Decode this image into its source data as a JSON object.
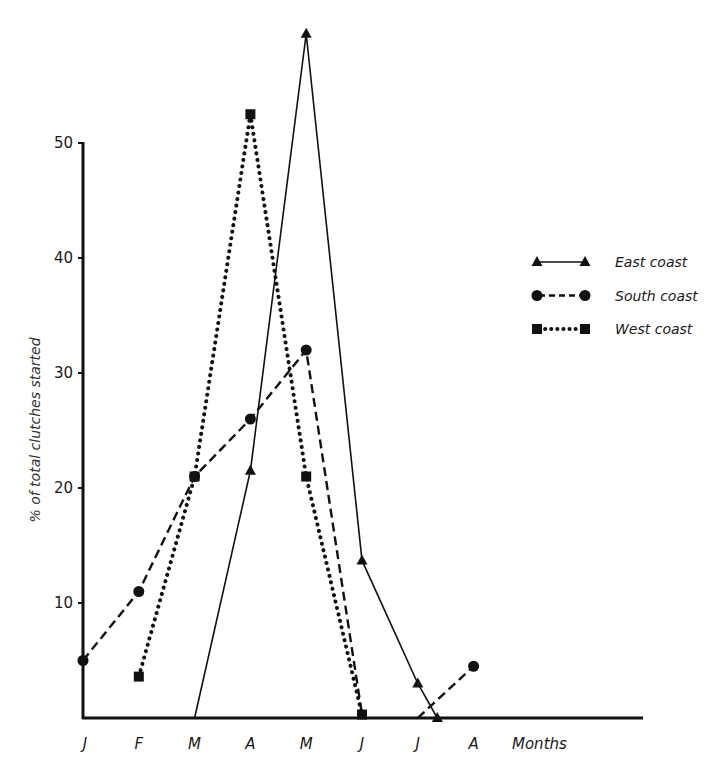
{
  "chart_data": {
    "type": "line",
    "title": "",
    "xlabel": "Months",
    "ylabel": "% of total clutches started",
    "categories": [
      "J",
      "F",
      "M",
      "A",
      "M",
      "J",
      "J",
      "A"
    ],
    "ylim": [
      0,
      60
    ],
    "yticks": [
      10,
      20,
      30,
      40,
      50
    ],
    "grid": false,
    "legend_position": "right",
    "series": [
      {
        "name": "East coast",
        "marker": "triangle",
        "line_style": "solid",
        "points": [
          {
            "x": 2,
            "y": 0
          },
          {
            "x": 3,
            "y": 21.5
          },
          {
            "x": 4,
            "y": 59.5
          },
          {
            "x": 5,
            "y": 13.7
          },
          {
            "x": 6,
            "y": 3
          },
          {
            "x": 6.35,
            "y": 0
          }
        ]
      },
      {
        "name": "South coast",
        "marker": "circle",
        "line_style": "dashed",
        "points": [
          {
            "x": 0,
            "y": 5
          },
          {
            "x": 1,
            "y": 11
          },
          {
            "x": 2,
            "y": 21
          },
          {
            "x": 3,
            "y": 26
          },
          {
            "x": 4,
            "y": 32
          },
          {
            "x": 5,
            "y": 0.3
          },
          {
            "x": 6,
            "y": 0
          },
          {
            "x": 7,
            "y": 4.5
          }
        ]
      },
      {
        "name": "West coast",
        "marker": "square",
        "line_style": "dotted",
        "points": [
          {
            "x": 1,
            "y": 3.6
          },
          {
            "x": 2,
            "y": 21
          },
          {
            "x": 3,
            "y": 52.5
          },
          {
            "x": 4,
            "y": 21
          },
          {
            "x": 5,
            "y": 0.3
          }
        ]
      }
    ],
    "markers_shown": {
      "East coast": [
        1,
        2,
        3,
        4,
        5
      ],
      "South coast": [
        0,
        1,
        2,
        3,
        4,
        7
      ],
      "West coast": [
        0,
        1,
        2,
        3,
        4
      ]
    }
  }
}
